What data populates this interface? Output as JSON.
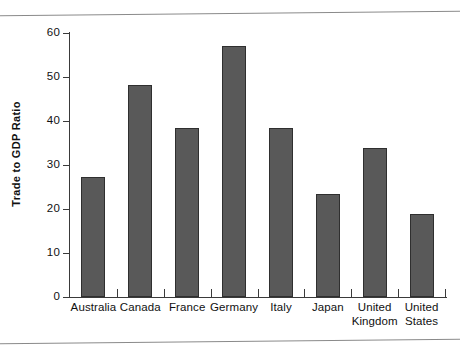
{
  "chart_data": {
    "type": "bar",
    "title": "",
    "subtitle": "",
    "xlabel": "",
    "ylabel": "Trade to GDP Ratio",
    "ylim": [
      0,
      60
    ],
    "ytick_values": [
      0,
      10,
      20,
      30,
      40,
      50,
      60
    ],
    "ytick_labels": [
      "0",
      "10",
      "20",
      "30",
      "40",
      "50",
      "60"
    ],
    "grid": false,
    "legend": "none",
    "bar_color": "#595959",
    "bar_outline_color": "#2f2f2f",
    "axis_color": "#3a3a3a",
    "categories": [
      "Australia",
      "Canada",
      "France",
      "Germany",
      "Italy",
      "Japan",
      "United Kingdom",
      "United States"
    ],
    "category_lines": [
      [
        "Australia"
      ],
      [
        "Canada"
      ],
      [
        "France"
      ],
      [
        "Germany"
      ],
      [
        "Italy"
      ],
      [
        "Japan"
      ],
      [
        "United",
        "Kingdom"
      ],
      [
        "United",
        "States"
      ]
    ],
    "values": [
      27.3,
      48.2,
      38.3,
      57.0,
      38.4,
      23.5,
      33.9,
      18.8
    ]
  }
}
